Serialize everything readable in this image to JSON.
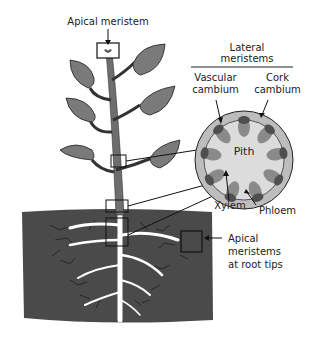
{
  "labels": {
    "apical_meristem": "Apical meristem",
    "lateral_meristems_line1": "Lateral",
    "lateral_meristems_line2": "meristems",
    "vascular_cambium_line1": "Vascular",
    "vascular_cambium_line2": "cambium",
    "cork_cambium_line1": "Cork",
    "cork_cambium_line2": "cambium",
    "pith": "Pith",
    "xylem": "Xylem",
    "phloem": "Phloem",
    "root_tips_line1": "Apical",
    "root_tips_line2": "meristems",
    "root_tips_line3": "at root tips"
  },
  "colors": {
    "leaf": "#7a7a7a",
    "stem": "#6e6e6e",
    "soil": "#4a4a4a",
    "root": "#ffffff",
    "cortex": "#bdbdbd",
    "pith": "#e0e0e0",
    "xylem": "#8a8a8a",
    "phloem": "#555555"
  }
}
